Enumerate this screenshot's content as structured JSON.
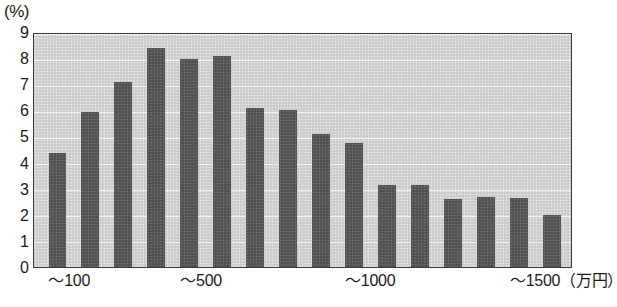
{
  "axis": {
    "unit_label": "(%)",
    "y_tick_labels": [
      "9",
      "8",
      "7",
      "6",
      "5",
      "4",
      "3",
      "2",
      "1",
      "0"
    ],
    "x_tick_labels": [
      "～100",
      "～500",
      "～1000",
      "～1500（万円）"
    ]
  },
  "chart_data": {
    "type": "bar",
    "title": "",
    "xlabel": "（万円）",
    "ylabel": "(%)",
    "ylim": [
      0,
      9
    ],
    "yticks": [
      0,
      1,
      2,
      3,
      4,
      5,
      6,
      7,
      8,
      9
    ],
    "grid": true,
    "legend": "none",
    "bar_color": "#585858",
    "plot_background": "#d2d2d2",
    "categories": [
      "～100",
      "～200",
      "～300",
      "～400",
      "～500",
      "～600",
      "～700",
      "～800",
      "～900",
      "～1000",
      "～1100",
      "～1200",
      "～1300",
      "～1400",
      "～1500",
      "1500～"
    ],
    "values": [
      4.35,
      5.95,
      7.1,
      8.4,
      7.95,
      8.1,
      6.1,
      6.0,
      5.1,
      4.75,
      3.15,
      3.15,
      2.6,
      2.7,
      2.65,
      2.0
    ],
    "x_axis_tick_positions": [
      {
        "label": "～100",
        "index": 0
      },
      {
        "label": "～500",
        "index": 4
      },
      {
        "label": "～1000",
        "index": 9
      },
      {
        "label": "～1500（万円）",
        "index": 14
      }
    ]
  }
}
